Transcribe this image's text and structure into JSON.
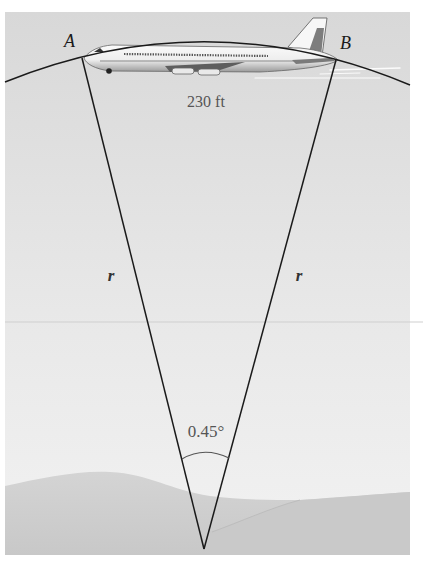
{
  "figure": {
    "labels": {
      "point_a": "A",
      "point_b": "B",
      "arc_length": "230 ft",
      "radius_left": "r",
      "radius_right": "r",
      "central_angle": "0.45°"
    },
    "colors": {
      "page_background": "#ffffff",
      "sky_top": "#d9d9d9",
      "sky_bottom": "#efefef",
      "hill_back": "#d6d6d6",
      "hill_front": "#cccccc",
      "line": "#1a1a1a",
      "text_gray": "#555555",
      "plane_body": "#f4f4f4",
      "plane_shadow": "#7a7a7a"
    },
    "geometry": {
      "panel": {
        "x": 5,
        "y": 12,
        "width": 405,
        "height": 543
      },
      "point_a": {
        "x": 82,
        "y": 58
      },
      "point_b": {
        "x": 336,
        "y": 60
      },
      "center": {
        "x": 204,
        "y": 549
      },
      "angle_deg": 0.45,
      "arc_length_ft": 230
    },
    "icons": {
      "airplane": "airplane-icon"
    }
  }
}
